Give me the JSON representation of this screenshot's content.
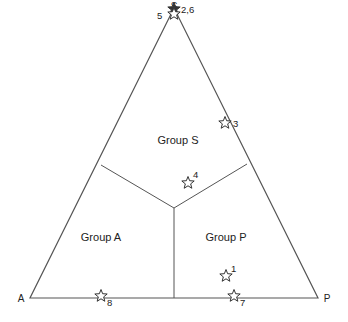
{
  "diagram": {
    "type": "ternary",
    "vertices": {
      "top": {
        "label": "S",
        "x": 174,
        "y": 8
      },
      "left": {
        "label": "A",
        "x": 30,
        "y": 298
      },
      "right": {
        "label": "P",
        "x": 318,
        "y": 298
      }
    },
    "regions": [
      {
        "label": "Group S",
        "x": 178,
        "y": 144
      },
      {
        "label": "Group A",
        "x": 101,
        "y": 241
      },
      {
        "label": "Group P",
        "x": 226,
        "y": 241
      }
    ],
    "points": [
      {
        "id": "1",
        "label": "1",
        "x": 226,
        "y": 276,
        "lx": 231,
        "ly": 272
      },
      {
        "id": "2,6",
        "label": "2,6",
        "x": 174,
        "y": 9,
        "lx": 181,
        "ly": 13,
        "filled": true
      },
      {
        "id": "3",
        "label": "3",
        "x": 225,
        "y": 123,
        "lx": 233,
        "ly": 127
      },
      {
        "id": "4",
        "label": "4",
        "x": 188,
        "y": 183,
        "lx": 193,
        "ly": 178
      },
      {
        "id": "5",
        "label": "5",
        "x": 174,
        "y": 14,
        "lx": 157,
        "ly": 19
      },
      {
        "id": "7",
        "label": "7",
        "x": 234,
        "y": 296,
        "lx": 240,
        "ly": 306
      },
      {
        "id": "8",
        "label": "8",
        "x": 101,
        "y": 296,
        "lx": 107,
        "ly": 306
      }
    ],
    "colors": {
      "line": "#555555",
      "star": "#333333",
      "text": "#222222"
    }
  }
}
